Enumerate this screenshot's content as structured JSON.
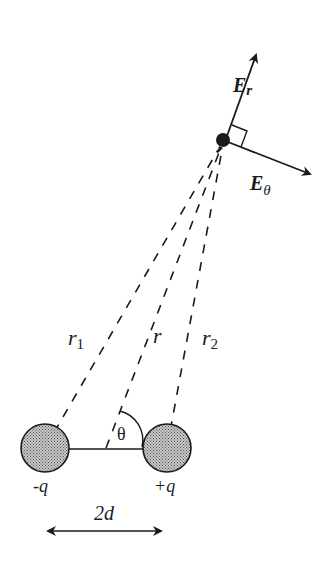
{
  "diagram": {
    "charges": [
      {
        "id": "neg",
        "label": "-q",
        "cx": 45,
        "cy": 448,
        "r": 24
      },
      {
        "id": "pos",
        "label": "+q",
        "cx": 167,
        "cy": 448,
        "r": 24
      }
    ],
    "separation_label": "2d",
    "angle_label": "θ",
    "distances": {
      "r1": "r",
      "r1_sub": "1",
      "r": "r",
      "r2": "r",
      "r2_sub": "2"
    },
    "field_point": {
      "cx": 223,
      "cy": 140
    },
    "field_vectors": {
      "radial": {
        "label": "E",
        "sub": "r"
      },
      "theta": {
        "label": "E",
        "sub": "θ"
      }
    },
    "colors": {
      "ink": "#1a1a1a",
      "fill": "#9a9a9a",
      "background": "#ffffff"
    }
  }
}
